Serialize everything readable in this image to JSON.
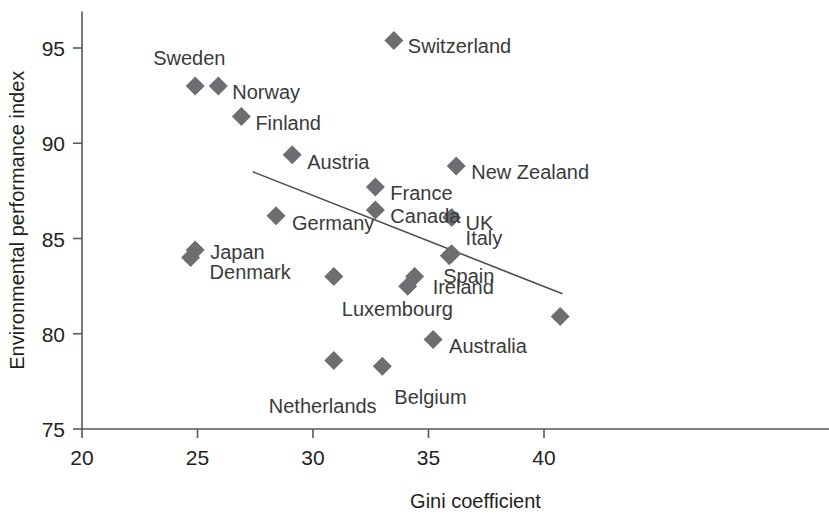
{
  "chart_data": {
    "type": "scatter",
    "title": "",
    "xlabel": "Gini coefficient",
    "ylabel": "Environmental performance index",
    "xlim": [
      20,
      41.5
    ],
    "ylim": [
      75,
      96.5
    ],
    "xticks": [
      20,
      25,
      30,
      35,
      40
    ],
    "yticks": [
      75,
      80,
      85,
      90,
      95
    ],
    "xtick_labels": [
      "20",
      "25",
      "30",
      "35",
      "40"
    ],
    "ytick_labels": [
      "75",
      "80",
      "85",
      "90",
      "95"
    ],
    "grid": false,
    "legend": "none",
    "marker_shape": "diamond",
    "marker_color": "#6d6e71",
    "axis_color": "#58595b",
    "text_color": "#231f20",
    "label_color": "#3a3a3a",
    "points": [
      {
        "label": "Sweden",
        "x": 24.9,
        "y": 93.0,
        "label_dx": -42,
        "label_dy": -28,
        "label_anchor": "start"
      },
      {
        "label": "Norway",
        "x": 25.9,
        "y": 93.0,
        "label_dx": 14,
        "label_dy": 6,
        "label_anchor": "start"
      },
      {
        "label": "Finland",
        "x": 26.9,
        "y": 91.4,
        "label_dx": 14,
        "label_dy": 6,
        "label_anchor": "start"
      },
      {
        "label": "Switzerland",
        "x": 33.5,
        "y": 95.4,
        "label_dx": 14,
        "label_dy": 6,
        "label_anchor": "start"
      },
      {
        "label": "Austria",
        "x": 29.1,
        "y": 89.4,
        "label_dx": 15,
        "label_dy": 7,
        "label_anchor": "start"
      },
      {
        "label": "New Zealand",
        "x": 36.2,
        "y": 88.8,
        "label_dx": 15,
        "label_dy": 6,
        "label_anchor": "start"
      },
      {
        "label": "France",
        "x": 32.7,
        "y": 87.7,
        "label_dx": 15,
        "label_dy": 6,
        "label_anchor": "start"
      },
      {
        "label": "Canada",
        "x": 32.7,
        "y": 86.5,
        "label_dx": 15,
        "label_dy": 6,
        "label_anchor": "start"
      },
      {
        "label": "Germany",
        "x": 28.4,
        "y": 86.2,
        "label_dx": 16,
        "label_dy": 7,
        "label_anchor": "start"
      },
      {
        "label": "UK",
        "x": 36.0,
        "y": 86.1,
        "label_dx": 14,
        "label_dy": 5,
        "label_anchor": "start"
      },
      {
        "label": "Italy",
        "x": 36.0,
        "y": 84.2,
        "label_dx": 14,
        "label_dy": -16,
        "label_anchor": "start"
      },
      {
        "label": "Spain",
        "x": 35.9,
        "y": 84.1,
        "label_dx": -6,
        "label_dy": 20,
        "label_anchor": "start"
      },
      {
        "label": "Japan",
        "x": 24.9,
        "y": 84.4,
        "label_dx": 15,
        "label_dy": 2,
        "label_anchor": "start"
      },
      {
        "label": "Denmark",
        "x": 24.7,
        "y": 84.0,
        "label_dx": 19,
        "label_dy": 14,
        "label_anchor": "start"
      },
      {
        "label": "Luxembourg",
        "x": 30.9,
        "y": 83.0,
        "label_dx": 8,
        "label_dy": 32,
        "label_anchor": "start"
      },
      {
        "label": "Ireland",
        "x": 34.4,
        "y": 83.0,
        "label_dx": 18,
        "label_dy": 10,
        "label_anchor": "start"
      },
      {
        "label": "",
        "x": 34.1,
        "y": 82.5,
        "label_dx": 0,
        "label_dy": 0,
        "label_anchor": "start"
      },
      {
        "label": "Australia",
        "x": 35.2,
        "y": 79.7,
        "label_dx": 16,
        "label_dy": 7,
        "label_anchor": "start"
      },
      {
        "label": "Netherlands",
        "x": 30.9,
        "y": 78.6,
        "label_dx": -65,
        "label_dy": 46,
        "label_anchor": "start"
      },
      {
        "label": "Belgium",
        "x": 33.0,
        "y": 78.3,
        "label_dx": 12,
        "label_dy": 31,
        "label_anchor": "start"
      },
      {
        "label": "",
        "x": 40.7,
        "y": 80.9,
        "label_dx": 0,
        "label_dy": 0,
        "label_anchor": "start"
      }
    ],
    "trend_line": {
      "x1": 27.4,
      "y1": 88.5,
      "x2": 40.8,
      "y2": 82.1
    }
  }
}
